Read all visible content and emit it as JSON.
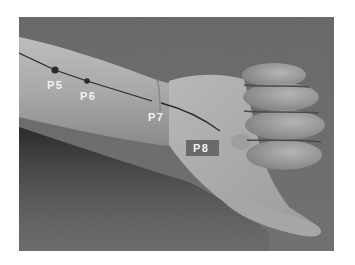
{
  "figure": {
    "background_color": "#6e6e6e",
    "line_color": "#2a2a2a",
    "points": [
      {
        "id": "p5",
        "label": "P5",
        "x": 36,
        "y": 53,
        "label_x": 28,
        "label_y": 72,
        "has_dot": true
      },
      {
        "id": "p6",
        "label": "P6",
        "x": 68,
        "y": 64,
        "label_x": 61,
        "label_y": 83,
        "has_dot": true
      },
      {
        "id": "p7",
        "label": "P7",
        "x": 138,
        "y": 85,
        "label_x": 129,
        "label_y": 104,
        "has_dot": false
      },
      {
        "id": "p8",
        "label": "P8",
        "x": 183,
        "y": 130,
        "label_x": 174,
        "label_y": 135,
        "has_dot": false,
        "boxed": true,
        "box_color": "#6a6a6a"
      }
    ]
  }
}
